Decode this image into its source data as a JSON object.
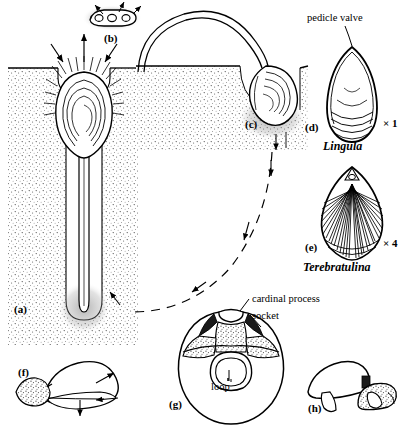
{
  "figure": {
    "panels": [
      {
        "id": "a",
        "label": "(a)",
        "desc": "Lingula in vertical burrow with pedicle"
      },
      {
        "id": "b",
        "label": "(b)",
        "desc": "Planktonic larva"
      },
      {
        "id": "c",
        "label": "(c)",
        "desc": "Juvenile settling with long pedicle"
      },
      {
        "id": "d",
        "label": "(d)",
        "desc": "Lingula shell exterior"
      },
      {
        "id": "e",
        "label": "(e)",
        "desc": "Terebratulina shell exterior"
      },
      {
        "id": "f",
        "label": "(f)",
        "desc": "Attached brachiopod gaping, feeding currents"
      },
      {
        "id": "g",
        "label": "(g)",
        "desc": "Brachial valve interior"
      },
      {
        "id": "h",
        "label": "(h)",
        "desc": "Brachiopod pair attached to substrate"
      }
    ],
    "callouts": {
      "pedicle_valve": "pedicle valve",
      "cardinal_process": "cardinal process",
      "socket": "socket",
      "loop": "loop"
    },
    "genera": {
      "lingula": "Lingula",
      "terebratulina": "Terebratulina"
    },
    "magnifications": {
      "lingula": "× 1",
      "terebratulina": "× 4"
    },
    "colors": {
      "ink": "#000000",
      "background": "#ffffff",
      "stipple": "#4a4a4a",
      "shade": "#b8b8b8"
    }
  }
}
